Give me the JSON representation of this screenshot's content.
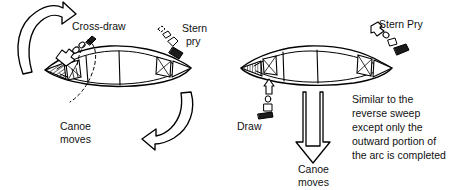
{
  "diagram": {
    "stroke_color": "#000000",
    "background_color": "#ffffff",
    "panels": [
      {
        "name": "left-panel",
        "maneuver": "cross-draw and stern pry turn",
        "labels": {
          "cross_draw": "Cross-draw",
          "stern_line1": "Stern",
          "stern_line2": "pry",
          "canoe_line1": "Canoe",
          "canoe_line2": "moves"
        },
        "arrows": [
          {
            "name": "top-curved-arrow",
            "direction": "counter-clockwise-up-right"
          },
          {
            "name": "bottom-curved-arrow",
            "direction": "clockwise-down-left"
          }
        ]
      },
      {
        "name": "right-panel",
        "maneuver": "draw and stern pry sideslip",
        "labels": {
          "stern_pry": "Stern Pry",
          "draw": "Draw",
          "canoe_line1": "Canoe",
          "canoe_line2": "moves",
          "note_line1": "Similar to the",
          "note_line2": "reverse sweep",
          "note_line3": "except only the",
          "note_line4": "outward portion of",
          "note_line5": "the arc is completed"
        },
        "arrows": [
          {
            "name": "down-arrow",
            "direction": "down"
          }
        ]
      }
    ]
  }
}
